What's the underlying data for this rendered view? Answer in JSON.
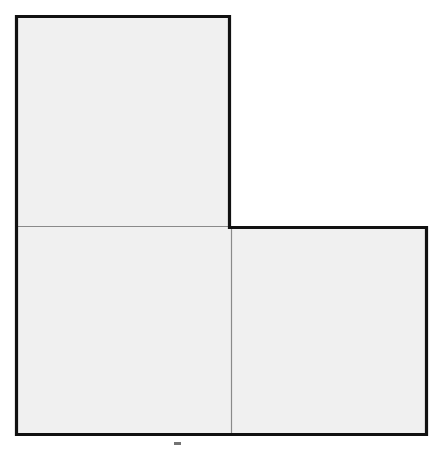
{
  "figure": {
    "background_color": "#ffffff",
    "face_fill_color": "#f0f0f0",
    "outline_color": "#111111",
    "divider_color": "#8a8a8a",
    "outline_width_px": 3,
    "divider_width_px": 1,
    "square_count": 3,
    "squares": [
      {
        "name": "top-square",
        "position": "upper-left",
        "x": 15,
        "y": 15,
        "width": 216,
        "height": 211,
        "fill": "#f0f0f0"
      },
      {
        "name": "bottom-left-square",
        "position": "lower-left",
        "x": 15,
        "y": 226,
        "width": 216,
        "height": 210,
        "fill": "#f0f0f0"
      },
      {
        "name": "bottom-right-square",
        "position": "lower-right",
        "x": 231,
        "y": 226,
        "width": 197,
        "height": 210,
        "fill": "#f0f0f0"
      }
    ],
    "dividers": [
      {
        "name": "horizontal-divider",
        "orientation": "horizontal",
        "x1": 15,
        "y1": 226,
        "x2": 231,
        "y2": 226
      },
      {
        "name": "vertical-divider",
        "orientation": "vertical",
        "x1": 231,
        "y1": 226,
        "x2": 231,
        "y2": 436
      }
    ],
    "outline_path": "M 16.5 16.5 L 229.5 16.5 L 229.5 227.5 L 426.5 227.5 L 426.5 434.5 L 16.5 434.5 Z",
    "artifact": {
      "name": "scan-artifact",
      "kind": "stray-mark",
      "x": 174,
      "y": 442,
      "width": 7,
      "height": 3
    },
    "caption": ""
  },
  "chart_data": {
    "type": "diagram",
    "shape": "L-tromino",
    "unit_squares": 3,
    "grid_columns": 2,
    "grid_rows": 2,
    "occupied_cells": [
      {
        "row": 0,
        "col": 0
      },
      {
        "row": 1,
        "col": 0
      },
      {
        "row": 1,
        "col": 1
      }
    ],
    "empty_cells": [
      {
        "row": 0,
        "col": 1
      }
    ],
    "xlabel": "",
    "ylabel": "",
    "grid": false,
    "legend": "none"
  }
}
